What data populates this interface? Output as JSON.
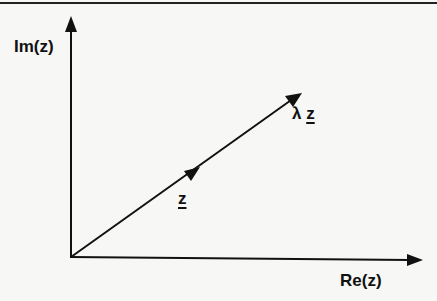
{
  "diagram": {
    "type": "complex-plane-vector-scaling",
    "axes": {
      "vertical_label": "Im(z)",
      "horizontal_label": "Re(z)"
    },
    "vectors": [
      {
        "name": "z",
        "label": "z",
        "underlined": true
      },
      {
        "name": "lambda-z",
        "label_prefix": "λ",
        "label": "z",
        "underlined": true
      }
    ],
    "colors": {
      "ink": "#111111",
      "background": "#f7f7f5"
    }
  }
}
